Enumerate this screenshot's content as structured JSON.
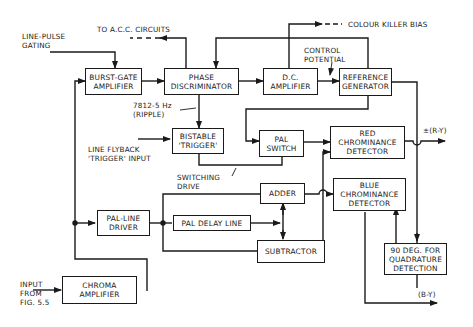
{
  "diagram": {
    "blocks": {
      "burst_gate": "BURST-GATE\nAMPLIFIER",
      "phase_disc": "PHASE\nDISCRIMINATOR",
      "dc_amp": "D.C.\nAMPLIFIER",
      "ref_gen": "REFERENCE\nGENERATOR",
      "bistable": "BISTABLE\n'TRIGGER'",
      "pal_switch": "PAL\nSWITCH",
      "red_det": "RED\nCHROMINANCE\nDETECTOR",
      "blue_det": "BLUE\nCHROMINANCE\nDETECTOR",
      "adder": "ADDER",
      "pal_line_driver": "PAL-LINE\nDRIVER",
      "pal_delay": "PAL DELAY LINE",
      "subtractor": "SUBTRACTOR",
      "quad": "90 DEG. FOR\nQUADRATURE\nDETECTION",
      "chroma_amp": "CHROMA\nAMPLIFIER"
    },
    "labels": {
      "line_pulse": "LINE-PULSE\nGATING",
      "acc": "TO A.C.C. CIRCUITS",
      "killer": "COLOUR KILLER BIAS",
      "control": "CONTROL\nPOTENTIAL",
      "ripple": "7812-5 Hz\n(RIPPLE)",
      "flyback": "LINE FLYBACK\n'TRIGGER' INPUT",
      "switching": "SWITCHING\nDRIVE",
      "r_y": "±(R-Y)",
      "b_y": "(B-Y)",
      "input": "INPUT\nFROM\nFIG. 5.5"
    }
  }
}
